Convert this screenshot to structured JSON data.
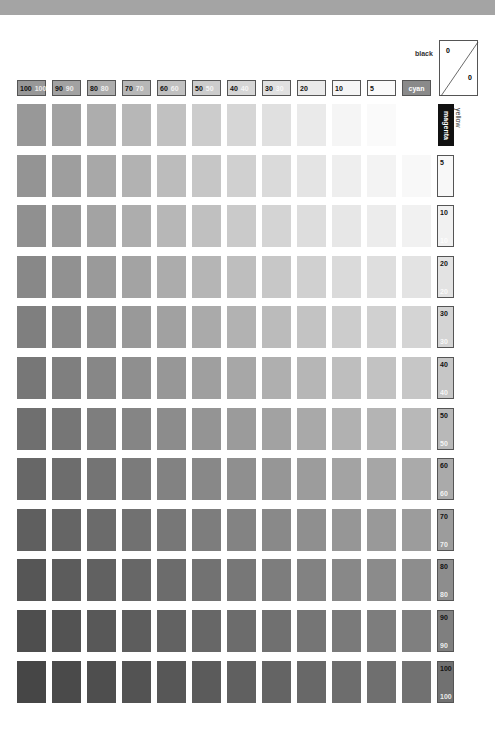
{
  "chart_data": {
    "type": "heatmap",
    "x_axis": {
      "label": "cyan",
      "categories": [
        "100",
        "90",
        "80",
        "70",
        "60",
        "50",
        "40",
        "30",
        "20",
        "10",
        "5",
        "0"
      ]
    },
    "y_axis": {
      "label": "magenta",
      "categories": [
        "0",
        "5",
        "10",
        "20",
        "30",
        "40",
        "50",
        "60",
        "70",
        "80",
        "90",
        "100"
      ]
    },
    "fixed_channels": {
      "black": 0,
      "yellow": 0
    },
    "grid": false,
    "legend_position": "top-right"
  },
  "header": {
    "columns": [
      {
        "k": "100",
        "w": "100"
      },
      {
        "k": "90",
        "w": "90"
      },
      {
        "k": "80",
        "w": "80"
      },
      {
        "k": "70",
        "w": "70"
      },
      {
        "k": "60",
        "w": "60"
      },
      {
        "k": "50",
        "w": "50"
      },
      {
        "k": "40",
        "w": "40"
      },
      {
        "k": "30",
        "w": "30"
      },
      {
        "k": "20",
        "w": ""
      },
      {
        "k": "10",
        "w": ""
      },
      {
        "k": "5",
        "w": ""
      }
    ],
    "cyan_label": "cyan"
  },
  "rows": [
    {
      "k": "",
      "w": ""
    },
    {
      "k": "5",
      "w": ""
    },
    {
      "k": "10",
      "w": "10"
    },
    {
      "k": "20",
      "w": "20"
    },
    {
      "k": "30",
      "w": "30"
    },
    {
      "k": "40",
      "w": "40"
    },
    {
      "k": "50",
      "w": "50"
    },
    {
      "k": "60",
      "w": "60"
    },
    {
      "k": "70",
      "w": "70"
    },
    {
      "k": "80",
      "w": "80"
    },
    {
      "k": "90",
      "w": "90"
    },
    {
      "k": "100",
      "w": "100"
    }
  ],
  "labels": {
    "magenta": "magenta",
    "yellow": "yellow",
    "black": "black",
    "key_top": "0",
    "key_bottom": "0"
  }
}
